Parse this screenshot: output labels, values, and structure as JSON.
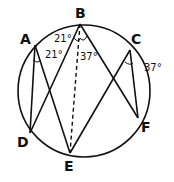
{
  "diagram": {
    "type": "inscribed-angles-circle",
    "points": {
      "A": {
        "label": "A",
        "x": 35,
        "y": 45
      },
      "B": {
        "label": "B",
        "x": 80,
        "y": 24
      },
      "C": {
        "label": "C",
        "x": 130,
        "y": 50
      },
      "D": {
        "label": "D",
        "x": 30,
        "y": 133
      },
      "E": {
        "label": "E",
        "x": 70,
        "y": 153
      },
      "F": {
        "label": "F",
        "x": 138,
        "y": 118
      }
    },
    "circle": {
      "cx": 84,
      "cy": 91,
      "r": 66
    },
    "angles": [
      {
        "at": "A",
        "label": "21°"
      },
      {
        "at": "B-left",
        "label": "21°"
      },
      {
        "at": "B-right",
        "label": "37°"
      },
      {
        "at": "C",
        "label": "37°"
      }
    ],
    "line_color": "#111111"
  }
}
